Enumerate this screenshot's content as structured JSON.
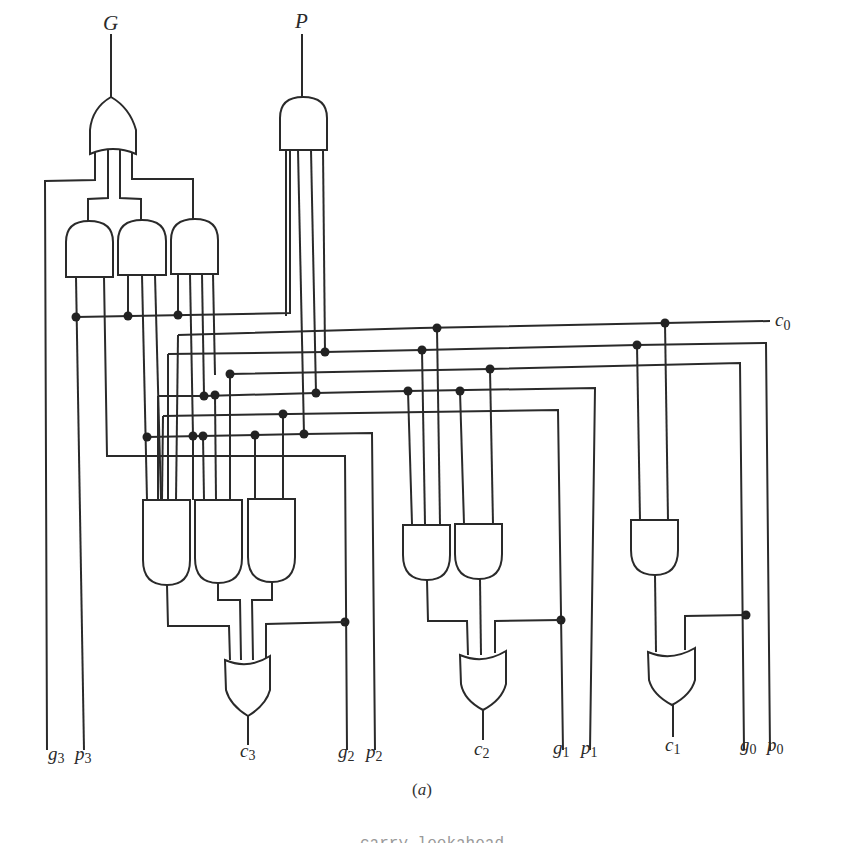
{
  "diagram": {
    "caption": "(a)",
    "caption_letter": "a",
    "truncated_footer": "carry lookahead generator",
    "outputs": {
      "G": {
        "label": "G",
        "gate": "OR"
      },
      "P": {
        "label": "P",
        "gate": "AND"
      }
    },
    "inputs": {
      "c0": {
        "base": "c",
        "sub": "0"
      }
    },
    "bottom_labels": [
      {
        "id": "g3",
        "base": "g",
        "sub": "3"
      },
      {
        "id": "p3",
        "base": "p",
        "sub": "3"
      },
      {
        "id": "c3",
        "base": "c",
        "sub": "3"
      },
      {
        "id": "g2",
        "base": "g",
        "sub": "2"
      },
      {
        "id": "p2",
        "base": "p",
        "sub": "2"
      },
      {
        "id": "c2",
        "base": "c",
        "sub": "2"
      },
      {
        "id": "g1",
        "base": "g",
        "sub": "1"
      },
      {
        "id": "p1",
        "base": "p",
        "sub": "1"
      },
      {
        "id": "c1",
        "base": "c",
        "sub": "1"
      },
      {
        "id": "g0",
        "base": "g",
        "sub": "0"
      },
      {
        "id": "p0",
        "base": "p",
        "sub": "0"
      }
    ],
    "gates": [
      {
        "id": "or-G",
        "type": "OR",
        "output": "G",
        "inputs": 4
      },
      {
        "id": "and-P",
        "type": "AND",
        "output": "P",
        "inputs": 4
      },
      {
        "id": "and-G1",
        "type": "AND",
        "inputs": 2
      },
      {
        "id": "and-G2",
        "type": "AND",
        "inputs": 3
      },
      {
        "id": "and-G3",
        "type": "AND",
        "inputs": 4
      },
      {
        "id": "and-c3-a",
        "type": "AND",
        "inputs": 4
      },
      {
        "id": "and-c3-b",
        "type": "AND",
        "inputs": 3
      },
      {
        "id": "and-c3-c",
        "type": "AND",
        "inputs": 2
      },
      {
        "id": "or-c3",
        "type": "OR",
        "output": "c3",
        "inputs": 4
      },
      {
        "id": "and-c2-a",
        "type": "AND",
        "inputs": 3
      },
      {
        "id": "and-c2-b",
        "type": "AND",
        "inputs": 2
      },
      {
        "id": "or-c2",
        "type": "OR",
        "output": "c2",
        "inputs": 3
      },
      {
        "id": "and-c1-a",
        "type": "AND",
        "inputs": 2
      },
      {
        "id": "or-c1",
        "type": "OR",
        "output": "c1",
        "inputs": 2
      }
    ],
    "colors": {
      "ink": "#2a2a2a",
      "background": "#ffffff"
    }
  }
}
